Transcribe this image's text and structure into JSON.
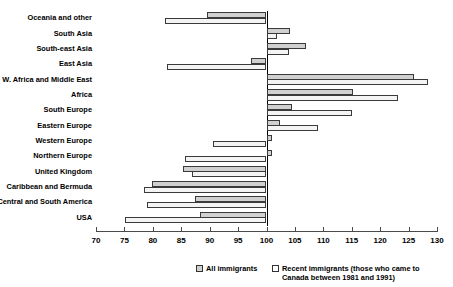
{
  "chart_data": {
    "type": "bar",
    "orientation": "horizontal",
    "title": "",
    "xlabel": "",
    "ylabel": "",
    "xlim": [
      70,
      130
    ],
    "xticks": [
      70,
      75,
      80,
      85,
      90,
      95,
      100,
      105,
      110,
      115,
      120,
      125,
      130
    ],
    "tick_labels": [
      "70",
      "75",
      "80",
      "85",
      "90",
      "95",
      "100",
      "105",
      "110",
      "115",
      "120",
      "125",
      "130"
    ],
    "reference_line": 100,
    "grid": false,
    "legend_position": "bottom",
    "categories": [
      "Oceania and other",
      "South Asia",
      "South-east Asia",
      "East Asia",
      "W. Africa and Middle East",
      "Africa",
      "South Europe",
      "Eastern Europe",
      "Western Europe",
      "Northern Europe",
      "United Kingdom",
      "Caribbean and Bermuda",
      "Central and South America",
      "USA"
    ],
    "series": [
      {
        "name": "All immigrants",
        "color": "#d0d0d0",
        "values": [
          89.6,
          104.2,
          107.0,
          97.3,
          126.0,
          115.2,
          104.4,
          102.3,
          101.0,
          100.9,
          85.3,
          79.8,
          87.5,
          88.3
        ]
      },
      {
        "name": "Recent immigrants (those who came to\nCanada between 1981 and 1991)",
        "color": "#f4f4f4",
        "values": [
          82.1,
          101.8,
          104.0,
          82.5,
          128.4,
          123.2,
          115.1,
          109.0,
          90.6,
          85.7,
          86.9,
          78.4,
          79.0,
          75.1
        ]
      }
    ]
  },
  "legend": {
    "all_label": "All immigrants",
    "recent_label": "Recent immigrants (those who came to\nCanada between 1981 and 1991)"
  }
}
